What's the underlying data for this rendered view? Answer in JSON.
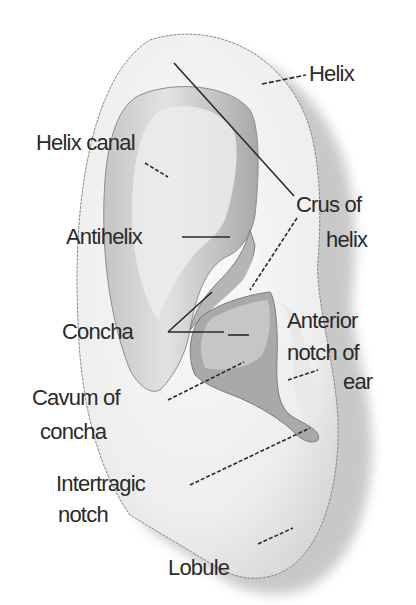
{
  "diagram": {
    "colors": {
      "background": "#ffffff",
      "ear_light": "#f4f4f4",
      "ear_mid": "#d2d2d2",
      "ear_dark": "#9a9a9a",
      "outline": "#8a8a8a",
      "leader": "#2a2a2a",
      "text": "#2a2a2a"
    },
    "labels": {
      "helix": "Helix",
      "helix_canal": "Helix canal",
      "crus_line1": "Crus of",
      "crus_line2": "helix",
      "antihelix": "Antihelix",
      "concha": "Concha",
      "anterior_line1": "Anterior",
      "anterior_line2": "notch of",
      "anterior_line3": "ear",
      "cavum_line1": "Cavum of",
      "cavum_line2": "concha",
      "intertragic_line1": "Intertragic",
      "intertragic_line2": "notch",
      "lobule": "Lobule"
    }
  }
}
